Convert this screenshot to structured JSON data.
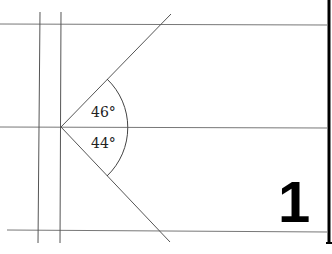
{
  "diagram": {
    "type": "angle-figure",
    "angles": [
      {
        "label": "46°",
        "position": "upper"
      },
      {
        "label": "44°",
        "position": "lower"
      }
    ],
    "figure_number": "1",
    "colors": {
      "line": "#555555",
      "text": "#222222",
      "border": "#000000"
    }
  }
}
